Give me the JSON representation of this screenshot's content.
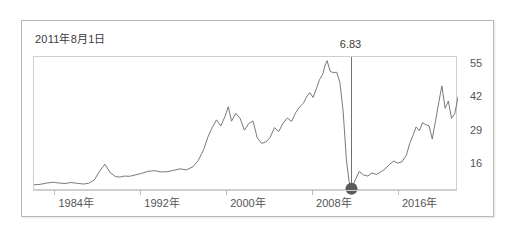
{
  "chart_data": {
    "type": "line",
    "title": "2011年8月1日",
    "xlabel": "",
    "ylabel": "",
    "grid": false,
    "legend": "none",
    "xlim": [
      1982.0,
      2021.5
    ],
    "ylim": [
      6.0,
      58.0
    ],
    "y_ticks": [
      55,
      42,
      29,
      16
    ],
    "y_tick_labels": [
      "55",
      "42",
      "29",
      "16"
    ],
    "x_ticks": [
      1984,
      1992,
      2000,
      2008,
      2016
    ],
    "x_tick_labels": [
      "1984年",
      "1992年",
      "2000年",
      "2008年",
      "2016年"
    ],
    "annotation": {
      "label": "6.83",
      "x": 2011.58,
      "y": 6.83,
      "marker": "filled-circle",
      "marker_color": "#5a5a5a",
      "line_color": "#6e6e6e"
    },
    "series": [
      {
        "name": "value",
        "color": "#6a6a6a",
        "x": [
          1982.0,
          1982.6,
          1983.2,
          1983.8,
          1984.3,
          1984.9,
          1985.4,
          1986.0,
          1986.6,
          1987.1,
          1987.6,
          1988.1,
          1988.6,
          1989.1,
          1989.6,
          1990.0,
          1990.4,
          1990.9,
          1991.4,
          1992.0,
          1992.6,
          1993.2,
          1993.8,
          1994.4,
          1995.0,
          1995.6,
          1996.2,
          1996.8,
          1997.3,
          1997.8,
          1998.2,
          1998.6,
          1999.0,
          1999.4,
          1999.8,
          2000.1,
          2000.4,
          2000.8,
          2001.2,
          2001.6,
          2002.0,
          2002.4,
          2002.8,
          2003.2,
          2003.6,
          2004.0,
          2004.4,
          2004.8,
          2005.2,
          2005.6,
          2006.0,
          2006.4,
          2006.8,
          2007.1,
          2007.4,
          2007.7,
          2008.0,
          2008.3,
          2008.6,
          2008.9,
          2009.1,
          2009.3,
          2009.6,
          2009.9,
          2010.2,
          2010.5,
          2010.8,
          2011.1,
          2011.35,
          2011.58,
          2011.9,
          2012.3,
          2012.7,
          2013.1,
          2013.5,
          2013.9,
          2014.3,
          2014.7,
          2015.1,
          2015.5,
          2015.9,
          2016.3,
          2016.7,
          2017.0,
          2017.3,
          2017.6,
          2017.9,
          2018.2,
          2018.5,
          2018.8,
          2019.1,
          2019.4,
          2019.7,
          2020.0,
          2020.3,
          2020.6,
          2020.9,
          2021.2,
          2021.5
        ],
        "y": [
          8.4,
          8.6,
          9.1,
          9.4,
          9.1,
          8.9,
          9.3,
          9.0,
          8.7,
          9.0,
          10.2,
          13.6,
          16.4,
          13.1,
          11.6,
          11.4,
          11.8,
          11.7,
          12.2,
          12.8,
          13.6,
          13.9,
          13.4,
          13.5,
          14.0,
          14.6,
          14.2,
          15.4,
          17.8,
          22.0,
          26.9,
          30.6,
          33.6,
          31.2,
          35.0,
          38.7,
          33.1,
          36.1,
          34.2,
          29.6,
          32.1,
          33.2,
          26.6,
          24.5,
          25.0,
          26.8,
          30.6,
          29.1,
          32.3,
          34.3,
          33.0,
          36.6,
          38.9,
          40.1,
          42.6,
          44.2,
          42.3,
          45.6,
          49.2,
          51.3,
          54.5,
          56.6,
          52.4,
          51.9,
          52.1,
          48.1,
          37.0,
          18.2,
          9.8,
          6.83,
          10.0,
          13.6,
          12.2,
          11.8,
          13.0,
          12.4,
          13.4,
          14.5,
          16.3,
          17.6,
          16.8,
          17.4,
          20.0,
          24.4,
          27.5,
          30.9,
          29.4,
          32.5,
          31.7,
          31.3,
          26.2,
          33.0,
          40.2,
          46.8,
          38.1,
          40.9,
          34.2,
          36.0,
          42.5
        ]
      }
    ]
  },
  "axis": {
    "y_labels": [
      "55",
      "42",
      "29",
      "16"
    ],
    "x_labels": [
      "1984年",
      "1992年",
      "2000年",
      "2008年",
      "2016年"
    ]
  },
  "annotation": {
    "value_label": "6.83"
  },
  "header": {
    "title": "2011年8月1日"
  }
}
